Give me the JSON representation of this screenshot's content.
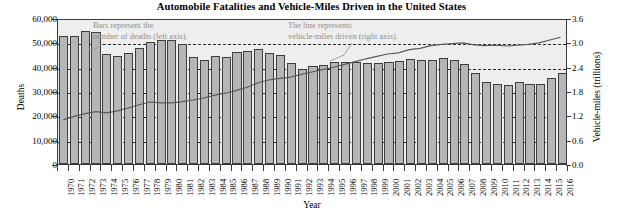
{
  "chart_data": {
    "type": "bar",
    "title": "Automobile Fatalities and Vehicle-Miles Driven in the United States",
    "xlabel": "Year",
    "ylabel": "Deaths",
    "y2label": "Vehicle-miles (trillions)",
    "ylim": [
      0,
      60000
    ],
    "y2lim": [
      0.0,
      3.6
    ],
    "grid": true,
    "legend_position": "none",
    "annotations": [
      "Bars represent the\nnumber of deaths (left axis).",
      "The line represents\nvehicle-miles driven (right axis)."
    ],
    "ytick_labels": [
      "60,000",
      "50,000",
      "40,000",
      "30,000",
      "20,000",
      "10,000",
      "0"
    ],
    "ytick_values": [
      60000,
      50000,
      40000,
      30000,
      20000,
      10000,
      0
    ],
    "y2tick_labels": [
      "3.6",
      "3.0",
      "2.4",
      "1.8",
      "1.2",
      "0.6",
      "0.0"
    ],
    "y2tick_values": [
      3.6,
      3.0,
      2.4,
      1.8,
      1.2,
      0.6,
      0.0
    ],
    "categories": [
      "1970",
      "1971",
      "1972",
      "1973",
      "1974",
      "1975",
      "1976",
      "1977",
      "1978",
      "1979",
      "1980",
      "1981",
      "1982",
      "1983",
      "1984",
      "1985",
      "1986",
      "1987",
      "1988",
      "1989",
      "1990",
      "1991",
      "1992",
      "1993",
      "1994",
      "1995",
      "1996",
      "1997",
      "1998",
      "1999",
      "2000",
      "2001",
      "2002",
      "2003",
      "2004",
      "2005",
      "2006",
      "2007",
      "2008",
      "2009",
      "2010",
      "2011",
      "2012",
      "2013",
      "2014",
      "2015",
      "2016"
    ],
    "series": [
      {
        "name": "Deaths",
        "type": "bar",
        "axis": "left",
        "values": [
          52627,
          52542,
          54589,
          54052,
          45196,
          44525,
          45523,
          47878,
          50331,
          51093,
          51091,
          49301,
          43945,
          42589,
          44257,
          43825,
          46087,
          46390,
          47087,
          45582,
          44599,
          41508,
          39250,
          40150,
          40716,
          41817,
          42065,
          42013,
          41501,
          41717,
          41945,
          42196,
          43005,
          42884,
          42836,
          43510,
          42708,
          41259,
          37423,
          33883,
          32999,
          32479,
          33782,
          32893,
          32744,
          35485,
          37461
        ]
      },
      {
        "name": "Vehicle-miles driven",
        "type": "line",
        "axis": "right",
        "values": [
          1.11,
          1.19,
          1.26,
          1.31,
          1.28,
          1.33,
          1.4,
          1.48,
          1.55,
          1.53,
          1.53,
          1.56,
          1.6,
          1.65,
          1.72,
          1.77,
          1.84,
          1.92,
          2.03,
          2.1,
          2.14,
          2.17,
          2.24,
          2.3,
          2.36,
          2.42,
          2.49,
          2.56,
          2.63,
          2.69,
          2.75,
          2.78,
          2.86,
          2.89,
          2.96,
          2.99,
          3.01,
          3.03,
          2.98,
          2.96,
          2.97,
          2.95,
          2.97,
          2.99,
          3.03,
          3.1,
          3.17
        ]
      }
    ]
  }
}
